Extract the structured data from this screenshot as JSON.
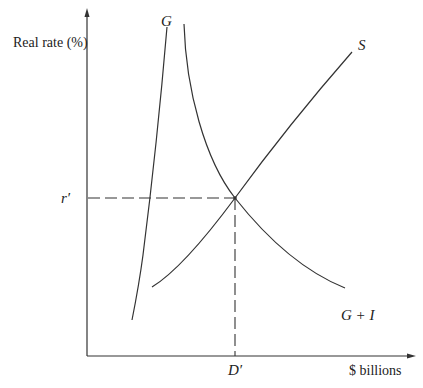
{
  "diagram": {
    "type": "supply-demand-curves",
    "y_axis_label": "Real rate (%)",
    "x_axis_label": "$ billions",
    "curves": [
      {
        "name": "G",
        "label": "G"
      },
      {
        "name": "G+I",
        "label": "G + I"
      },
      {
        "name": "S",
        "label": "S"
      }
    ],
    "equilibrium": {
      "rate_label": "r′",
      "quantity_label": "D′"
    },
    "colors": {
      "line": "#333333",
      "text": "#222222",
      "background": "#ffffff"
    }
  }
}
